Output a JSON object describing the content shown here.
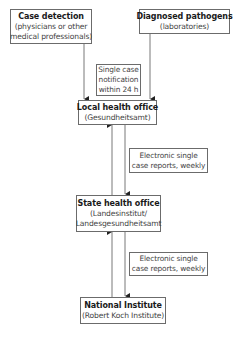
{
  "diagram": {
    "nodes": {
      "case_detection": {
        "title": "Case detection",
        "sub1": "(physicians or other",
        "sub2": "medical professionals)"
      },
      "diagnosed_pathogens": {
        "title": "Diagnosed pathogens",
        "sub1": "(laboratories)"
      },
      "local_health_office": {
        "title": "Local health office",
        "sub1": "(Gesundheitsamt)"
      },
      "state_health_office": {
        "title": "State health office",
        "sub1": "(Landesinstitut/",
        "sub2": "Landesgesundheitsamt"
      },
      "national_institute": {
        "title": "National Institute",
        "sub1": "(Robert Koch Institute)"
      }
    },
    "notes": {
      "single_case": {
        "line1": "Single case",
        "line2": "notification",
        "line3": "within 24 h"
      },
      "electronic_1": {
        "line1": "Electronic single",
        "line2": "case reports, weekly"
      },
      "electronic_2": {
        "line1": "Electronic single",
        "line2": "case reports, weekly"
      }
    },
    "edges": [
      {
        "from": "case_detection",
        "to": "local_health_office",
        "label": "single_case"
      },
      {
        "from": "diagnosed_pathogens",
        "to": "local_health_office",
        "label": "single_case"
      },
      {
        "from": "local_health_office",
        "to": "state_health_office",
        "label": "electronic_1"
      },
      {
        "from": "state_health_office",
        "to": "local_health_office",
        "label": ""
      },
      {
        "from": "state_health_office",
        "to": "national_institute",
        "label": "electronic_2"
      },
      {
        "from": "national_institute",
        "to": "state_health_office",
        "label": ""
      }
    ],
    "colors": {
      "line": "#3a3a3a",
      "border": "#6b6b6b",
      "text": "#1a1a1a"
    }
  }
}
